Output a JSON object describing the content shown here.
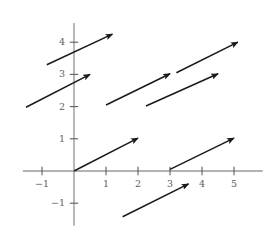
{
  "chart_data": {
    "type": "quiver",
    "title": "",
    "xlabel": "",
    "ylabel": "",
    "xlim": [
      -1.6,
      5.9
    ],
    "ylim": [
      -1.7,
      4.6
    ],
    "grid": false,
    "legend": null,
    "axis_color": "#9a9a9a",
    "arrow_color": "#1a1a1a",
    "tick_color": "#5d5d5d",
    "x_ticks": [
      {
        "value": -1,
        "label": "−1"
      },
      {
        "value": 1,
        "label": "1"
      },
      {
        "value": 2,
        "label": "2"
      },
      {
        "value": 3,
        "label": "3"
      },
      {
        "value": 4,
        "label": "4"
      },
      {
        "value": 5,
        "label": "5"
      }
    ],
    "y_ticks": [
      {
        "value": -1,
        "label": "−1"
      },
      {
        "value": 1,
        "label": "1"
      },
      {
        "value": 2,
        "label": "2"
      },
      {
        "value": 3,
        "label": "3"
      },
      {
        "value": 4,
        "label": "4"
      }
    ],
    "vectors": [
      {
        "name": "arrow-1",
        "tail": [
          -0.85,
          3.3
        ],
        "tip": [
          1.2,
          4.25
        ],
        "dx": 2.05,
        "dy": 0.95
      },
      {
        "name": "arrow-2",
        "tail": [
          -1.5,
          1.98
        ],
        "tip": [
          0.5,
          3.0
        ],
        "dx": 2.0,
        "dy": 1.02
      },
      {
        "name": "arrow-3",
        "tail": [
          1.0,
          2.05
        ],
        "tip": [
          3.0,
          3.02
        ],
        "dx": 2.0,
        "dy": 0.97
      },
      {
        "name": "arrow-4",
        "tail": [
          3.2,
          3.05
        ],
        "tip": [
          5.12,
          4.0
        ],
        "dx": 1.92,
        "dy": 0.95
      },
      {
        "name": "arrow-5",
        "tail": [
          2.25,
          2.02
        ],
        "tip": [
          4.5,
          3.02
        ],
        "dx": 2.25,
        "dy": 1.0
      },
      {
        "name": "arrow-6",
        "tail": [
          0.0,
          0.0
        ],
        "tip": [
          2.0,
          1.02
        ],
        "dx": 2.0,
        "dy": 1.02
      },
      {
        "name": "arrow-7",
        "tail": [
          3.0,
          0.05
        ],
        "tip": [
          5.0,
          1.02
        ],
        "dx": 2.0,
        "dy": 0.97
      },
      {
        "name": "arrow-8",
        "tail": [
          1.52,
          -1.42
        ],
        "tip": [
          3.58,
          -0.4
        ],
        "dx": 2.06,
        "dy": 1.02
      }
    ]
  }
}
